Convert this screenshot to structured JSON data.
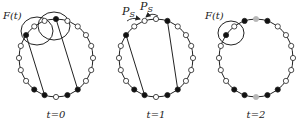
{
  "colors": {
    "stroke": "#222222",
    "filled": "#111111",
    "hollow": "#ffffff",
    "gray": "#b8b8b8"
  },
  "ring": {
    "count": 20,
    "rx": 37,
    "ry": 39,
    "node_r": 2.6
  },
  "panels": [
    {
      "caption": "t=0",
      "cx": 56,
      "cy": 58,
      "filled": [
        17,
        0,
        8,
        9,
        11,
        12
      ],
      "gray": [],
      "chords": [
        [
          17,
          11
        ],
        [
          0,
          8
        ]
      ],
      "annotation": {
        "text": "F(t)",
        "x": 3,
        "y": 19
      },
      "ellipses": [
        {
          "cx": 37,
          "cy": 31,
          "rx": 16,
          "ry": 14
        },
        {
          "cx": 54,
          "cy": 26,
          "rx": 16,
          "ry": 14
        }
      ],
      "arrows": []
    },
    {
      "caption": "t=1",
      "cx": 156,
      "cy": 58,
      "filled": [
        17,
        1,
        8,
        9,
        11,
        12
      ],
      "gray": [],
      "chords": [
        [
          17,
          11
        ],
        [
          1,
          8
        ]
      ],
      "annotation": null,
      "ellipses": [],
      "arrows": [
        {
          "label": "P_S",
          "lx": 122,
          "ly": 15,
          "path": "M 127 21 Q 132 17 140 19"
        },
        {
          "label": "P_S",
          "lx": 140,
          "ly": 10,
          "path": "M 158 16 Q 152 12 146 17"
        }
      ]
    },
    {
      "caption": "t=2",
      "cx": 256,
      "cy": 58,
      "filled": [
        17,
        19,
        1,
        8,
        9,
        11,
        12
      ],
      "gray": [
        0,
        10
      ],
      "chords": [],
      "annotation": {
        "text": "F(t)",
        "x": 205,
        "y": 19
      },
      "ellipses": [
        {
          "cx": 231,
          "cy": 33,
          "rx": 13,
          "ry": 12
        }
      ],
      "arrows": []
    }
  ]
}
